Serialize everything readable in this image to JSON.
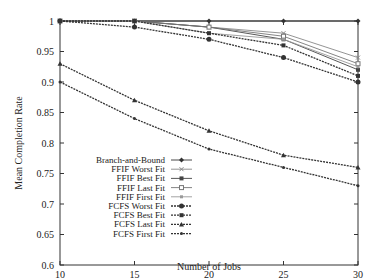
{
  "chart_data": {
    "type": "line",
    "title": "",
    "xlabel": "Number of Jobs",
    "ylabel": "Mean Completion Rate",
    "x": [
      10,
      15,
      20,
      25,
      30
    ],
    "xticks": [
      "10",
      "15",
      "20",
      "25",
      "30"
    ],
    "yticks": [
      "0.6",
      "0.65",
      "0.7",
      "0.75",
      "0.8",
      "0.85",
      "0.9",
      "0.95",
      "1"
    ],
    "xlim": [
      10,
      30
    ],
    "ylim": [
      0.6,
      1.0
    ],
    "grid": false,
    "legend_position": "lower-left inside",
    "series": [
      {
        "name": "Branch-and-Bound",
        "values": [
          1.0,
          1.0,
          1.0,
          1.0,
          1.0
        ],
        "marker": "diamond",
        "dash": "solid",
        "color": "#333333"
      },
      {
        "name": "FFIF Worst Fit",
        "values": [
          1.0,
          1.0,
          0.99,
          0.98,
          0.94
        ],
        "marker": "x",
        "dash": "solid",
        "color": "#888888"
      },
      {
        "name": "FFIF Best Fit",
        "values": [
          1.0,
          1.0,
          0.99,
          0.97,
          0.92
        ],
        "marker": "square-filled",
        "dash": "solid",
        "color": "#444444"
      },
      {
        "name": "FFIF Last Fit",
        "values": [
          1.0,
          1.0,
          0.99,
          0.975,
          0.93
        ],
        "marker": "square-open",
        "dash": "solid",
        "color": "#777777"
      },
      {
        "name": "FFIF First Fit",
        "values": [
          1.0,
          1.0,
          0.98,
          0.97,
          0.925
        ],
        "marker": "square-small",
        "dash": "solid",
        "color": "#999999"
      },
      {
        "name": "FCFS Worst Fit",
        "values": [
          1.0,
          0.99,
          0.97,
          0.94,
          0.9
        ],
        "marker": "circle",
        "dash": "dashed",
        "color": "#333333"
      },
      {
        "name": "FCFS Best Fit",
        "values": [
          1.0,
          1.0,
          0.98,
          0.96,
          0.91
        ],
        "marker": "square-filled",
        "dash": "dashed",
        "color": "#333333"
      },
      {
        "name": "FCFS Last Fit",
        "values": [
          0.93,
          0.87,
          0.82,
          0.78,
          0.76
        ],
        "marker": "triangle",
        "dash": "dashed",
        "color": "#333333"
      },
      {
        "name": "FCFS First Fit",
        "values": [
          0.9,
          0.84,
          0.79,
          0.76,
          0.73
        ],
        "marker": "dot",
        "dash": "dashed",
        "color": "#333333"
      }
    ]
  }
}
